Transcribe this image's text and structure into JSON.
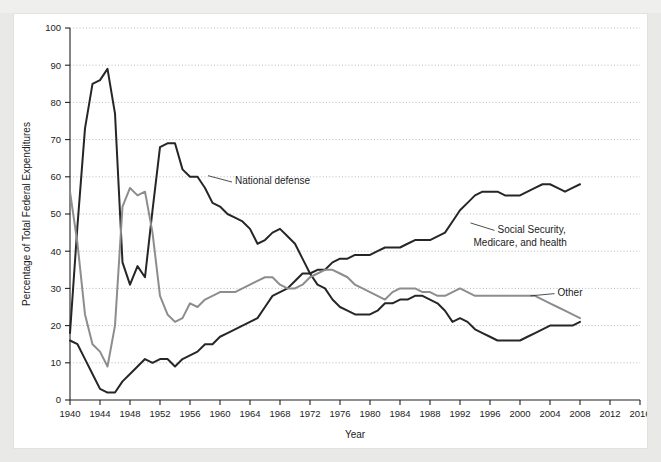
{
  "top_strip": {
    "partial_text": "· · · ·  ·  · ·   ·"
  },
  "chart_data": {
    "type": "line",
    "title": "",
    "xlabel": "Year",
    "ylabel": "Percentage of Total Federal Expenditures",
    "xlim": [
      1940,
      2016
    ],
    "ylim": [
      0,
      100
    ],
    "xticks": [
      1940,
      1944,
      1948,
      1952,
      1956,
      1960,
      1964,
      1968,
      1972,
      1976,
      1980,
      1984,
      1988,
      1992,
      1996,
      2000,
      2004,
      2008,
      2012,
      2016
    ],
    "yticks": [
      0,
      10,
      20,
      30,
      40,
      50,
      60,
      70,
      80,
      90,
      100
    ],
    "grid": "horizontal-dotted",
    "legend_position": "inline-annotations",
    "colors": {
      "national_defense": "#262626",
      "social_security": "#262626",
      "other": "#8d8d8d"
    },
    "x": [
      1940,
      1941,
      1942,
      1943,
      1944,
      1945,
      1946,
      1947,
      1948,
      1949,
      1950,
      1951,
      1952,
      1953,
      1954,
      1955,
      1956,
      1957,
      1958,
      1959,
      1960,
      1961,
      1962,
      1963,
      1964,
      1965,
      1966,
      1967,
      1968,
      1969,
      1970,
      1971,
      1972,
      1973,
      1974,
      1975,
      1976,
      1977,
      1978,
      1979,
      1980,
      1981,
      1982,
      1983,
      1984,
      1985,
      1986,
      1987,
      1988,
      1989,
      1990,
      1991,
      1992,
      1993,
      1994,
      1995,
      1996,
      1997,
      1998,
      1999,
      2000,
      2001,
      2002,
      2003,
      2004,
      2005,
      2006,
      2007,
      2008
    ],
    "series": [
      {
        "name": "National defense",
        "color": "#262626",
        "values": [
          18,
          47,
          73,
          85,
          86,
          89,
          77,
          37,
          31,
          36,
          33,
          51,
          68,
          69,
          69,
          62,
          60,
          60,
          57,
          53,
          52,
          50,
          49,
          48,
          46,
          42,
          43,
          45,
          46,
          44,
          42,
          38,
          34,
          31,
          30,
          27,
          25,
          24,
          23,
          23,
          23,
          24,
          26,
          26,
          27,
          27,
          28,
          28,
          27,
          26,
          24,
          21,
          22,
          21,
          19,
          18,
          17,
          16,
          16,
          16,
          16,
          17,
          18,
          19,
          20,
          20,
          20,
          20,
          21
        ]
      },
      {
        "name": "Social Security, Medicare, and health",
        "color": "#262626",
        "values": [
          16,
          15,
          11,
          7,
          3,
          2,
          2,
          5,
          7,
          9,
          11,
          10,
          11,
          11,
          9,
          11,
          12,
          13,
          15,
          15,
          17,
          18,
          19,
          20,
          21,
          22,
          25,
          28,
          29,
          30,
          32,
          34,
          34,
          35,
          35,
          37,
          38,
          38,
          39,
          39,
          39,
          40,
          41,
          41,
          41,
          42,
          43,
          43,
          43,
          44,
          45,
          48,
          51,
          53,
          55,
          56,
          56,
          56,
          55,
          55,
          55,
          56,
          57,
          58,
          58,
          57,
          56,
          57,
          58
        ]
      },
      {
        "name": "Other",
        "color": "#8d8d8d",
        "values": [
          56,
          42,
          23,
          15,
          13,
          9,
          20,
          52,
          57,
          55,
          56,
          45,
          28,
          23,
          21,
          22,
          26,
          25,
          27,
          28,
          29,
          29,
          29,
          30,
          31,
          32,
          33,
          33,
          31,
          30,
          30,
          31,
          33,
          34,
          35,
          35,
          34,
          33,
          31,
          30,
          29,
          28,
          27,
          29,
          30,
          30,
          30,
          29,
          29,
          28,
          28,
          29,
          30,
          29,
          28,
          28,
          28,
          28,
          28,
          28,
          28,
          28,
          28,
          27,
          26,
          25,
          24,
          23,
          22
        ]
      }
    ],
    "annotations": [
      {
        "name": "National defense",
        "lines": [
          "National defense"
        ],
        "x": 1962,
        "y": 58
      },
      {
        "name": "Social Security, Medicare, and health",
        "lines": [
          "Social Security,",
          "Medicare, and health"
        ],
        "x": 1997,
        "y": 45
      },
      {
        "name": "Other",
        "lines": [
          "Other"
        ],
        "x": 2005,
        "y": 28
      }
    ]
  }
}
